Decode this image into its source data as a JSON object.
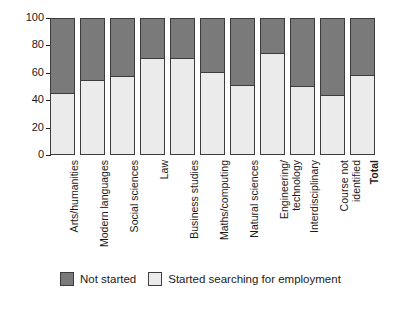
{
  "chart_data": {
    "type": "bar",
    "subtype": "stacked-percentage-column",
    "title": "",
    "xlabel": "",
    "ylabel": "",
    "ylim": [
      0,
      100
    ],
    "yticks": [
      0,
      20,
      40,
      60,
      80,
      100
    ],
    "grid": false,
    "legend_position": "bottom-left",
    "categories": [
      "Arts/humanities",
      "Modern languages",
      "Social sciences",
      "Law",
      "Business studies",
      "Maths/computing",
      "Natural sciences",
      "Engineering/\ntechnology",
      "Interdisciplinary",
      "Course not\nidentified",
      "Total"
    ],
    "categories_bold": [
      false,
      false,
      false,
      false,
      false,
      false,
      false,
      false,
      false,
      false,
      true
    ],
    "series": [
      {
        "name": "Started searching for employment",
        "color": "#ebebeb",
        "values": [
          45,
          55,
          58,
          71,
          71,
          60.5,
          51,
          74.5,
          50.5,
          44,
          58.5
        ]
      },
      {
        "name": "Not started",
        "color": "#7a7a7a",
        "values": [
          55,
          45,
          42,
          29,
          29,
          39.5,
          49,
          25.5,
          49.5,
          56,
          41.5
        ]
      }
    ],
    "legend": [
      {
        "label": "Not started",
        "swatch": "dark",
        "color": "#7a7a7a"
      },
      {
        "label": "Started searching for employment",
        "swatch": "light",
        "color": "#ebebeb"
      }
    ]
  },
  "colors": {
    "not_started": "#7a7a7a",
    "started_searching": "#ebebeb",
    "axis": "#202020",
    "bar_outline": "#3c3c3c",
    "background": "#ffffff"
  }
}
